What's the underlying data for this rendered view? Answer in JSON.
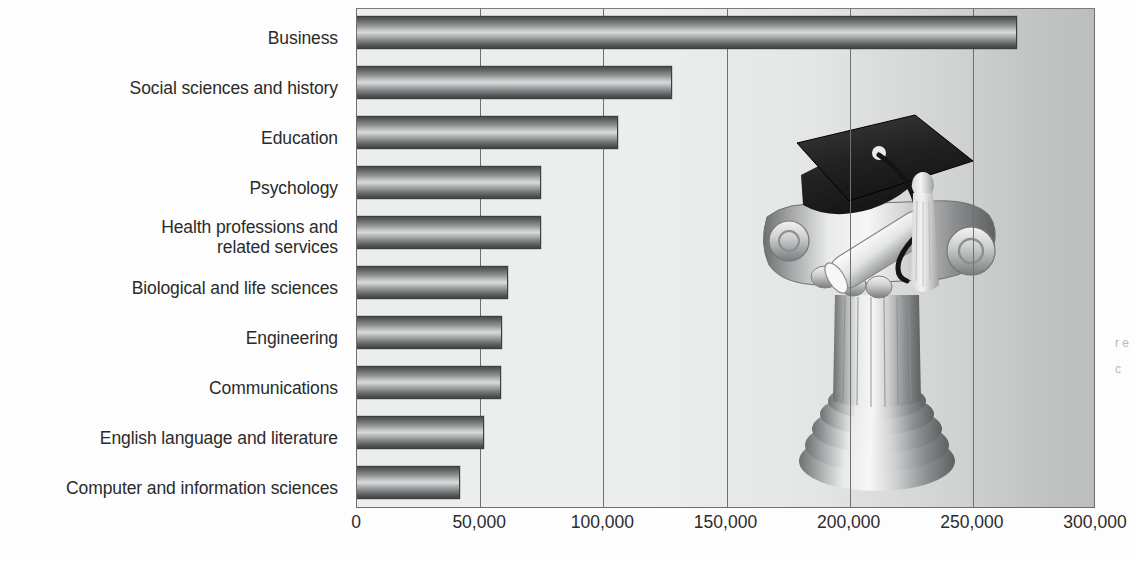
{
  "chart_data": {
    "type": "bar",
    "orientation": "horizontal",
    "title": "",
    "subtitle": "",
    "xlabel": "",
    "ylabel": "",
    "categories": [
      "Business",
      "Social sciences and history",
      "Education",
      "Psychology",
      "Health professions and\nrelated services",
      "Biological and life sciences",
      "Engineering",
      "Communications",
      "English language and literature",
      "Computer and information sciences"
    ],
    "values": [
      268000,
      128000,
      106000,
      74500,
      74500,
      61500,
      59000,
      58500,
      51500,
      42000
    ],
    "xlim": [
      0,
      300000
    ],
    "xticks": [
      0,
      50000,
      100000,
      150000,
      200000,
      250000,
      300000
    ],
    "xticklabels": [
      "0",
      "50,000",
      "100,000",
      "150,000",
      "200,000",
      "250,000",
      "300,000"
    ],
    "grid": "vertical",
    "legend": "none",
    "bar_color": "#8a8b8b",
    "plot_background": "#e9eaea",
    "axis_color": "#6f7071",
    "text_color": "#2b2b2b"
  },
  "artwork": {
    "name": "graduation-cap-on-column-illustration",
    "description": "Graduation mortarboard cap with tassel and diploma scroll resting on an Ionic column capital"
  },
  "edge_marks": {
    "text": "r\ne\nc"
  }
}
